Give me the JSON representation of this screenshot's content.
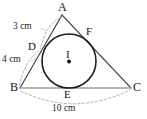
{
  "figure": {
    "type": "geometry-diagram",
    "background_color": "#ffffff",
    "stroke_color": "#2b2b2b",
    "base_line_color": "#9a9a9a",
    "dashed_color": "#8c8c8c",
    "vertices": [
      {
        "id": "A",
        "label": "A",
        "x": 62,
        "y": 14
      },
      {
        "id": "B",
        "label": "B",
        "x": 20,
        "y": 88
      },
      {
        "id": "C",
        "label": "C",
        "x": 131,
        "y": 88
      }
    ],
    "touch_points": [
      {
        "id": "D",
        "label": "D",
        "side": "AB",
        "x": 41,
        "y": 50
      },
      {
        "id": "E",
        "label": "E",
        "side": "BC",
        "x": 69,
        "y": 88
      },
      {
        "id": "F",
        "label": "F",
        "side": "AC",
        "x": 89,
        "y": 36
      }
    ],
    "incenter": {
      "id": "I",
      "label": "I",
      "x": 69,
      "y": 61
    },
    "incircle": {
      "cx": 69,
      "cy": 61,
      "r": 27
    },
    "dimensions": [
      {
        "id": "AD",
        "label": "3 cm",
        "value": 3,
        "unit": "cm",
        "from": "A",
        "to": "D",
        "label_x": 14,
        "label_y": 26
      },
      {
        "id": "DB",
        "label": "4 cm",
        "value": 4,
        "unit": "cm",
        "from": "D",
        "to": "B",
        "label_x": 3,
        "label_y": 59
      },
      {
        "id": "BC",
        "label": "10 cm",
        "value": 10,
        "unit": "cm",
        "from": "B",
        "to": "C",
        "label_x": 52,
        "label_y": 104
      }
    ]
  }
}
